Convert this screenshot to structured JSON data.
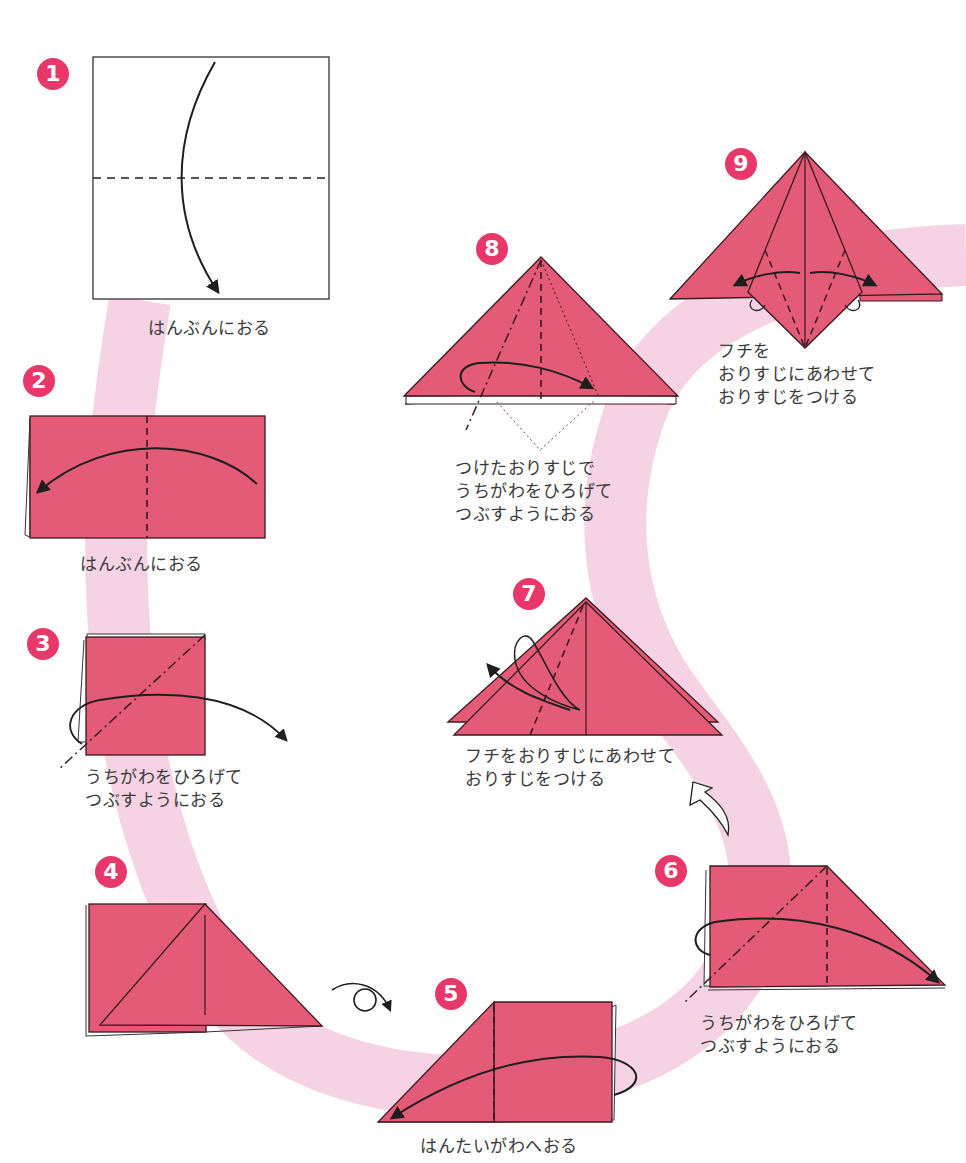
{
  "colors": {
    "paper": "#e35b77",
    "paper_edge": "#3a1a20",
    "ribbon": "#f6d3e4",
    "badge": "#e8386a",
    "text": "#3a3a3a",
    "line": "#1e1e1e"
  },
  "steps": [
    {
      "number": "1",
      "lines": [
        "はんぶんにおる"
      ],
      "fold": "valley-fold-half-horizontal"
    },
    {
      "number": "2",
      "lines": [
        "はんぶんにおる"
      ],
      "fold": "valley-fold-half-vertical"
    },
    {
      "number": "3",
      "lines": [
        "うちがわをひろげて",
        "つぶすようにおる"
      ],
      "fold": "squash-fold"
    },
    {
      "number": "4",
      "lines": [],
      "fold": "turn-over"
    },
    {
      "number": "5",
      "lines": [
        "はんたいがわへおる"
      ],
      "fold": "valley-fold-to-other-side"
    },
    {
      "number": "6",
      "lines": [
        "うちがわをひろげて",
        "つぶすようにおる"
      ],
      "fold": "squash-fold"
    },
    {
      "number": "7",
      "lines": [
        "フチをおりすじにあわせて",
        "おりすじをつける"
      ],
      "fold": "crease-edge-to-center"
    },
    {
      "number": "8",
      "lines": [
        "つけたおりすじで",
        "うちがわをひろげて",
        "つぶすようにおる"
      ],
      "fold": "squash-fold-on-crease"
    },
    {
      "number": "9",
      "lines": [
        "フチを",
        "おりすじにあわせて",
        "おりすじをつける"
      ],
      "fold": "crease-edges-to-center"
    }
  ],
  "symbols": {
    "turn_over": "turn-over-icon",
    "next_arrow": "hollow-curved-arrow-icon"
  }
}
